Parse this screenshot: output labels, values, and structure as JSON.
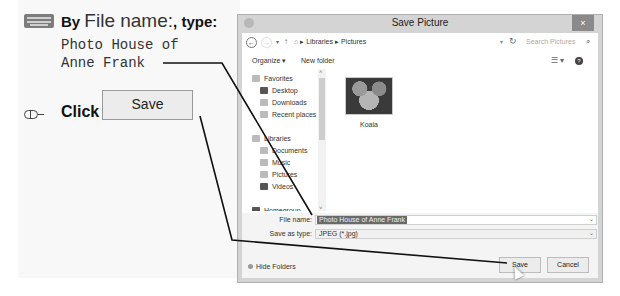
{
  "instructions": {
    "step1": {
      "prefix": "By ",
      "field_name": "File name:",
      "suffix": ", type:",
      "typed_text": "Photo House of\nAnne Frank",
      "icon": "keyboard-icon"
    },
    "step2": {
      "action": "Click",
      "button_label": "Save",
      "icon": "mouse-icon"
    }
  },
  "dialog": {
    "title": "Save Picture",
    "close_label": "×",
    "navbar": {
      "back": "←",
      "forward": "→",
      "dropdown": "▾",
      "up": "↑",
      "breadcrumb": [
        "Libraries",
        "Pictures"
      ],
      "crumb_separator": "▸",
      "refresh": "↻",
      "search_placeholder": "Search Pictures",
      "search_icon": "⌕"
    },
    "toolbar": {
      "organize": "Organize ▾",
      "new_folder": "New folder",
      "view": "☰ ▾",
      "help": "?"
    },
    "nav_pane": {
      "items": [
        {
          "label": "Favorites",
          "level": 0
        },
        {
          "label": "Desktop",
          "level": 1
        },
        {
          "label": "Downloads",
          "level": 1
        },
        {
          "label": "Recent places",
          "level": 1
        },
        {
          "label": "Libraries",
          "level": 0
        },
        {
          "label": "Documents",
          "level": 1
        },
        {
          "label": "Music",
          "level": 1
        },
        {
          "label": "Pictures",
          "level": 1
        },
        {
          "label": "Videos",
          "level": 1
        },
        {
          "label": "Homegroup",
          "level": 0
        }
      ]
    },
    "files": [
      {
        "name": "Koala"
      }
    ],
    "fields": {
      "file_name_label": "File name:",
      "file_name_value": "Photo House of Anne Frank",
      "save_type_label": "Save as type:",
      "save_type_value": "JPEG (*.jpg)"
    },
    "footer": {
      "hide_folders": "Hide Folders",
      "save": "Save",
      "cancel": "Cancel"
    }
  }
}
